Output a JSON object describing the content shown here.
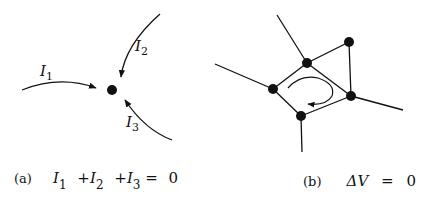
{
  "panel_a": {
    "tag": "(a)",
    "currents": [
      {
        "symbol": "I",
        "subscript": "1"
      },
      {
        "symbol": "I",
        "subscript": "2"
      },
      {
        "symbol": "I",
        "subscript": "3"
      }
    ],
    "equation": {
      "term1": "I",
      "sub1": "1",
      "plus1": "+",
      "term2": "I",
      "sub2": "2",
      "plus2": "+",
      "term3": "I",
      "sub3": "3",
      "equals": "=",
      "rhs": "0"
    }
  },
  "panel_b": {
    "tag": "(b)",
    "equation": {
      "lhs": "ΔV",
      "equals": "=",
      "rhs": "0"
    }
  },
  "colors": {
    "ink": "#111111",
    "background": "#ffffff"
  }
}
